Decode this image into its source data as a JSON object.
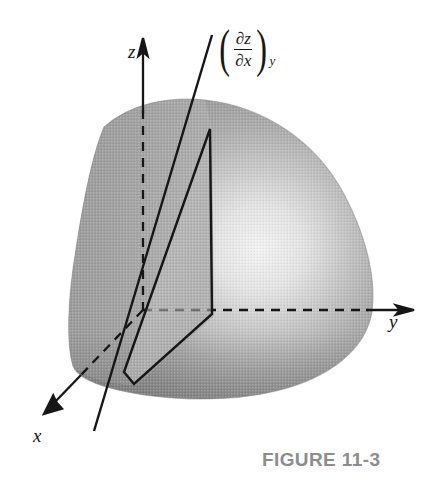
{
  "figure": {
    "caption": "FIGURE 11-3",
    "caption_color": "#8d8d8d",
    "background_color": "#ffffff",
    "stroke_color": "#161616",
    "surface_shading": {
      "dark_gray": "#8e8e8e",
      "mid_gray": "#a8a8a8",
      "light_gray": "#c9c9c9",
      "highlight": "#ededed",
      "edge_shadow": "#7d7d7d"
    }
  },
  "axes": {
    "z": {
      "label": "z",
      "direction": "up",
      "arrowhead": true,
      "solid_from_origin": false
    },
    "y": {
      "label": "y",
      "direction": "right",
      "arrowhead": true
    },
    "x": {
      "label": "x",
      "direction": "down-left",
      "arrowhead": true
    }
  },
  "annotation": {
    "open_paren": "(",
    "close_paren": ")",
    "numerator": "∂z",
    "denominator": "∂x",
    "subscript": "y",
    "plain_text": "(∂z/∂x)_y"
  },
  "elements": {
    "surface_name": "curved-surface-z-of-x-y",
    "cutting_plane_name": "constant-y-cutting-plane",
    "tangent_line_name": "tangent-line-slope"
  }
}
